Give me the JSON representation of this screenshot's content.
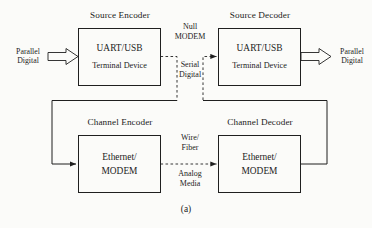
{
  "figure": {
    "caption": "(a)",
    "background_color": "#fbfbf9",
    "line_color": "#1f1f1f"
  },
  "blocks": [
    {
      "id": "source-encoder",
      "title": "Source Encoder",
      "main_text": "UART/USB",
      "sub_text": "Terminal Device"
    },
    {
      "id": "source-decoder",
      "title": "Source Decoder",
      "main_text": "UART/USB",
      "sub_text": "Terminal Device"
    },
    {
      "id": "channel-encoder",
      "title": "Channel Encoder",
      "main_text": "Ethernet/",
      "sub_text": "MODEM"
    },
    {
      "id": "channel-decoder",
      "title": "Channel Decoder",
      "main_text": "Ethernet/",
      "sub_text": "MODEM"
    }
  ],
  "io": {
    "input_label": "Parallel\nDigital",
    "output_label": "Parallel\nDigital"
  },
  "interfaces": {
    "null_modem": "Null\nMODEM",
    "serial_digital": "Serial\nDigital",
    "wire_fiber": "Wire/\nFiber",
    "analog_media": "Analog\nMedia"
  }
}
